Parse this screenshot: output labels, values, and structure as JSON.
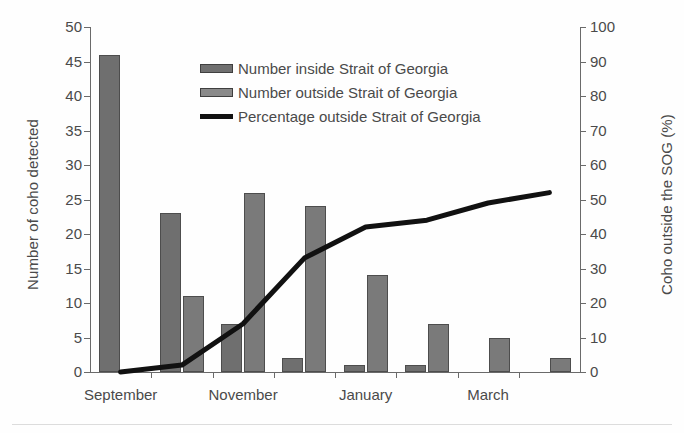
{
  "chart_data": {
    "type": "bar",
    "title": "",
    "xlabel": "",
    "ylabel": "Number of coho detected",
    "y2label": "Coho outside the SOG (%)",
    "ylim": [
      0,
      50
    ],
    "y2lim": [
      0,
      100
    ],
    "yticks": [
      "0",
      "5",
      "10",
      "15",
      "20",
      "25",
      "30",
      "35",
      "40",
      "45",
      "50"
    ],
    "y2ticks": [
      "0",
      "10",
      "20",
      "30",
      "40",
      "50",
      "60",
      "70",
      "80",
      "90",
      "100"
    ],
    "grid": false,
    "legend_position": "upper-center",
    "categories": [
      "September",
      "October",
      "November",
      "December",
      "January",
      "February",
      "March",
      "April"
    ],
    "xtick_labels": [
      "September",
      "November",
      "January",
      "March"
    ],
    "series": [
      {
        "name": "Number inside Strait of Georgia",
        "axis": "left",
        "type": "bar",
        "color": "#6f6f6f",
        "values": [
          46,
          23,
          7,
          2,
          1,
          1,
          0,
          0
        ]
      },
      {
        "name": "Number outside Strait of Georgia",
        "axis": "left",
        "type": "bar",
        "color": "#7a7a7a",
        "values": [
          0,
          11,
          26,
          24,
          14,
          7,
          5,
          2
        ]
      },
      {
        "name": "Percentage outside Strait of Georgia",
        "axis": "right",
        "type": "line",
        "color": "#111111",
        "values": [
          0,
          2,
          14,
          33,
          42,
          44,
          49,
          52
        ]
      }
    ]
  },
  "legend": {
    "items": [
      {
        "label": "Number inside Strait of Georgia",
        "swatch": "inside"
      },
      {
        "label": "Number outside Strait of Georgia",
        "swatch": "outside"
      },
      {
        "label": "Percentage outside Strait of Georgia",
        "swatch": "line"
      }
    ]
  }
}
